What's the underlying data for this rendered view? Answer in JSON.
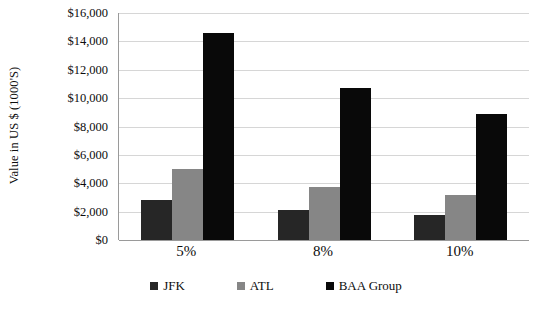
{
  "chart_data": {
    "type": "bar",
    "title": "",
    "xlabel": "",
    "ylabel": "Value in US $ (1000'S)",
    "categories": [
      "5%",
      "8%",
      "10%"
    ],
    "series": [
      {
        "name": "JFK",
        "color": "#262626",
        "values": [
          2850,
          2100,
          1750
        ]
      },
      {
        "name": "ATL",
        "color": "#868686",
        "values": [
          5000,
          3750,
          3150
        ]
      },
      {
        "name": "BAA Group",
        "color": "#090909",
        "values": [
          14600,
          10700,
          8900
        ]
      }
    ],
    "ylim": [
      0,
      16000
    ],
    "ytick_values": [
      0,
      2000,
      4000,
      6000,
      8000,
      10000,
      12000,
      14000,
      16000
    ],
    "ytick_labels": [
      "$0",
      "$2,000",
      "$4,000",
      "$6,000",
      "$8,000",
      "$10,000",
      "$12,000",
      "$14,000",
      "$16,000"
    ],
    "grid": true,
    "grid_axis": "y",
    "legend_position": "bottom",
    "legend_entries": [
      "JFK",
      "ATL",
      "BAA Group"
    ],
    "background_color": "#ffffff",
    "gridline_color": "#d6d6d6",
    "axis_color": "#9a9a9a",
    "text_color": "#0d0d0d"
  }
}
